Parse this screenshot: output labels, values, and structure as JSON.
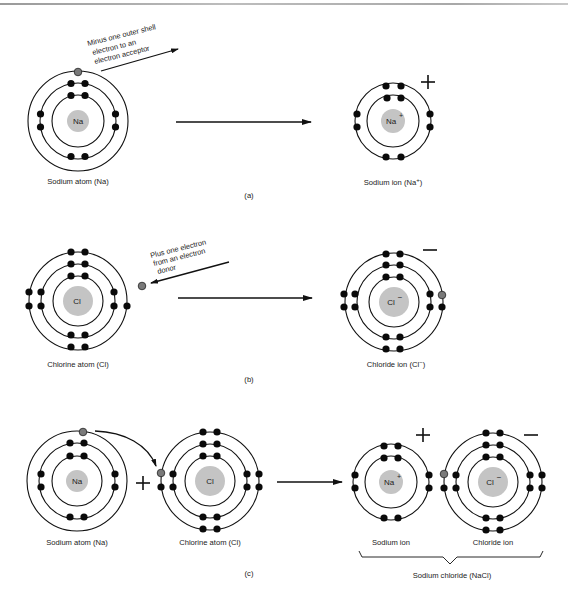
{
  "figure": {
    "panels": [
      {
        "id": "a",
        "label": "(a)",
        "left_atom": {
          "symbol": "Na",
          "caption": "Sodium atom (Na)"
        },
        "right_atom": {
          "symbol": "Na",
          "charge": "+",
          "caption": "Sodium ion (Na",
          "caption_sup": "+",
          "caption_end": ")"
        },
        "annotation": [
          "Minus one outer shell",
          "electron to an",
          "electron acceptor"
        ],
        "ion_charge_sign": "+"
      },
      {
        "id": "b",
        "label": "(b)",
        "left_atom": {
          "symbol": "Cl",
          "caption": "Chlorine atom (Cl)"
        },
        "right_atom": {
          "symbol": "Cl",
          "charge": "−",
          "caption": "Chloride ion (Cl",
          "caption_sup": "−",
          "caption_end": ")"
        },
        "annotation": [
          "Plus one electron",
          "from an electron",
          "donor"
        ],
        "ion_charge_sign": "−"
      },
      {
        "id": "c",
        "label": "(c)",
        "reactants": [
          {
            "symbol": "Na",
            "caption": "Sodium atom (Na)"
          },
          {
            "symbol": "Cl",
            "caption": "Chlorine atom (Cl)"
          }
        ],
        "reactant_operator": "+",
        "products": [
          {
            "symbol": "Na",
            "charge": "+",
            "caption": "Sodium ion",
            "sign": "+"
          },
          {
            "symbol": "Cl",
            "charge": "−",
            "caption": "Chloride ion",
            "sign": "−"
          }
        ],
        "product_group_caption": "Sodium chloride (NaCl)"
      }
    ],
    "colors": {
      "nucleus": "#c4c4c4",
      "electron": "#0a0a0a",
      "transferred_electron": "#7a7a7a",
      "line": "#111111"
    }
  }
}
